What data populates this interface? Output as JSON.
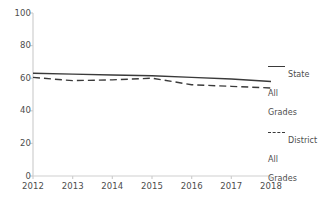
{
  "chart_data": {
    "type": "line",
    "title": "",
    "subtitle": "",
    "xlabel": "",
    "ylabel": "",
    "x": [
      2012,
      2013,
      2014,
      2015,
      2016,
      2017,
      2018
    ],
    "xtick_labels": [
      "2012",
      "2013",
      "2014",
      "2015",
      "2016",
      "2017",
      "2018"
    ],
    "xlim": [
      2012,
      2018
    ],
    "ylim": [
      0,
      100
    ],
    "ytick_labels": [
      "0",
      "20",
      "40",
      "60",
      "80",
      "100"
    ],
    "yticks": [
      0,
      20,
      40,
      60,
      80,
      100
    ],
    "grid": false,
    "legend_position": "right",
    "series": [
      {
        "name": "State\nAll\nGrades",
        "style": "solid",
        "color": "#3a3a3a",
        "values": [
          63,
          62.5,
          62,
          61.5,
          60.5,
          59.5,
          58
        ]
      },
      {
        "name": "District\nAll\nGrades",
        "style": "dashed",
        "color": "#3a3a3a",
        "values": [
          60.5,
          58.5,
          59,
          60,
          56,
          55,
          54
        ]
      }
    ]
  },
  "axes": {
    "axis_color": "#cfcfcf",
    "tick_color": "#cfcfcf",
    "label_color": "#4d4d4d"
  },
  "legend": {
    "entries": [
      {
        "label": "State\nAll\nGrades",
        "style": "solid"
      },
      {
        "label": "District\nAll\nGrades",
        "style": "dashed"
      }
    ]
  },
  "background": "#ffffff"
}
